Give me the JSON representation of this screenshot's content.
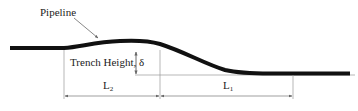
{
  "diagram": {
    "labels": {
      "pipeline": "Pipeline",
      "trench_height": "Trench Height, δ",
      "length_left_main": "L",
      "length_left_sub": "2",
      "length_right_main": "L",
      "length_right_sub": "1"
    },
    "colors": {
      "pipe": "#111111",
      "dimension": "#888888",
      "text": "#222222"
    }
  }
}
